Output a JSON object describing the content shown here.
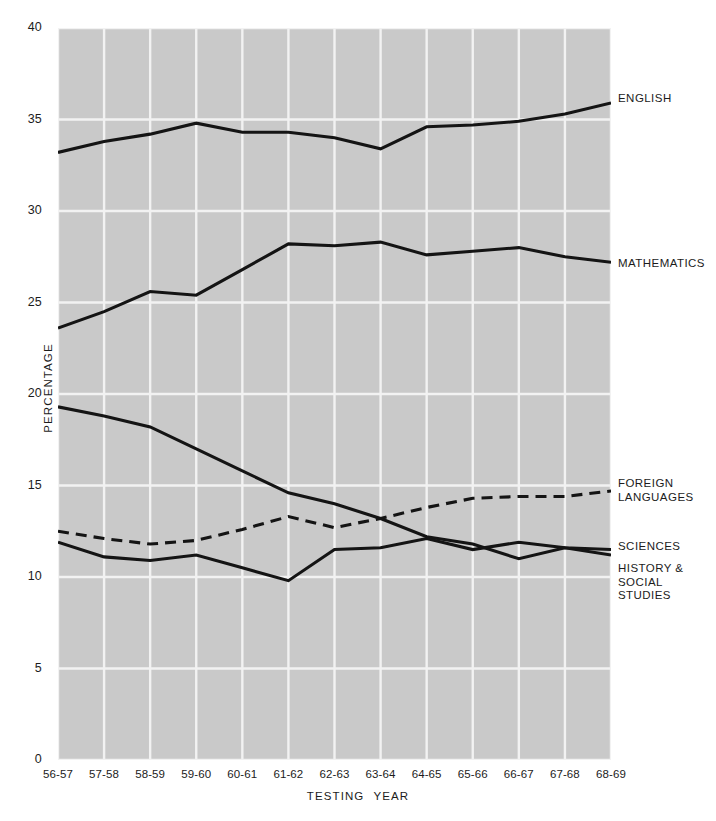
{
  "figure": {
    "title_fragment": "",
    "background": "#ffffff",
    "plot_background": "#c9c9c9",
    "grid_color": "#f2f2f2",
    "line_color": "#141414"
  },
  "axis": {
    "y_label": "PERCENTAGE",
    "x_label_part1": "TESTING",
    "x_label_part2": "YEAR",
    "y_ticks": [
      "0",
      "5",
      "10",
      "15",
      "20",
      "25",
      "30",
      "35",
      "40"
    ],
    "x_ticks": [
      "56-57",
      "57-58",
      "58-59",
      "59-60",
      "60-61",
      "61-62",
      "62-63",
      "63-64",
      "64-65",
      "65-66",
      "66-67",
      "67-68",
      "68-69"
    ]
  },
  "series_labels": {
    "english": "ENGLISH",
    "mathematics": "MATHEMATICS",
    "foreign_languages": "FOREIGN\nLANGUAGES",
    "sciences": "SCIENCES",
    "history_social_studies": "HISTORY &\nSOCIAL\nSTUDIES"
  },
  "chart_data": {
    "type": "line",
    "title": "",
    "xlabel": "TESTING YEAR",
    "ylabel": "PERCENTAGE",
    "xlim": [
      0,
      12
    ],
    "ylim": [
      0,
      40
    ],
    "ytick_step": 5,
    "grid": true,
    "legend_position": "right-of-axes (inline end labels)",
    "categories": [
      "56-57",
      "57-58",
      "58-59",
      "59-60",
      "60-61",
      "61-62",
      "62-63",
      "63-64",
      "64-65",
      "65-66",
      "66-67",
      "67-68",
      "68-69"
    ],
    "series": [
      {
        "name": "ENGLISH",
        "style": "solid",
        "color": "#141414",
        "values": [
          33.2,
          33.8,
          34.2,
          34.8,
          34.3,
          34.3,
          34.0,
          33.4,
          34.6,
          34.7,
          34.9,
          35.3,
          35.9
        ]
      },
      {
        "name": "MATHEMATICS",
        "style": "solid",
        "color": "#141414",
        "values": [
          23.6,
          24.5,
          25.6,
          25.4,
          26.8,
          28.2,
          28.1,
          28.3,
          27.6,
          27.8,
          28.0,
          27.5,
          27.2
        ]
      },
      {
        "name": "FOREIGN LANGUAGES",
        "style": "solid",
        "color": "#141414",
        "values": [
          19.3,
          18.8,
          18.2,
          17.0,
          15.8,
          14.6,
          14.0,
          13.2,
          12.2,
          11.8,
          11.0,
          11.6,
          11.2
        ]
      },
      {
        "name": "SCIENCES",
        "style": "dashed",
        "color": "#141414",
        "values": [
          12.5,
          12.1,
          11.8,
          12.0,
          12.6,
          13.3,
          12.7,
          13.2,
          13.8,
          14.3,
          14.4,
          14.4,
          14.7
        ]
      },
      {
        "name": "HISTORY & SOCIAL STUDIES",
        "style": "solid",
        "color": "#141414",
        "values": [
          11.9,
          11.1,
          10.9,
          11.2,
          10.5,
          9.8,
          11.5,
          11.6,
          12.1,
          11.5,
          11.9,
          11.6,
          11.5
        ]
      }
    ]
  }
}
